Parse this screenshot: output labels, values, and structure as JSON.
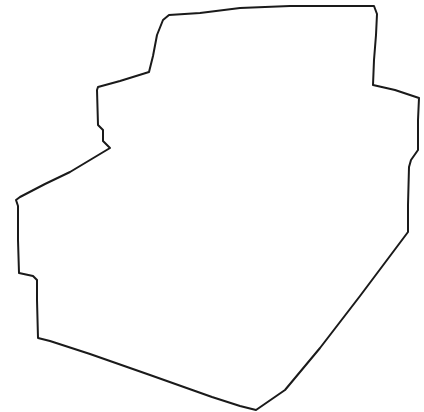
{
  "drawing": {
    "description": "Hand-drawn closed outline shape",
    "stroke_color": "#1a1a1a",
    "background": "#ffffff",
    "stroke_width": 2,
    "path": "M16,200 L20,197 L45,184 L70,172 L95,157 L110,148 L103,141 L103,130 L98,125 L97,90 L98,87 L120,81 L149,72 L153,56 L157,35 L163,20 L169,15 L200,13 L240,8 L290,6 L340,6 L374,6 L377,14 L376,35 L374,60 L373,85 L395,90 L419,98 L418,120 L418,150 L411,160 L409,167 L408,205 L408,232 L396,248 L360,296 L320,348 L285,390 L256,410 L240,406 L212,397 L150,375 L90,354 L50,341 L38,338 L37,300 L37,280 L33,276 L19,273 L18,240 L18,206 Z"
  }
}
